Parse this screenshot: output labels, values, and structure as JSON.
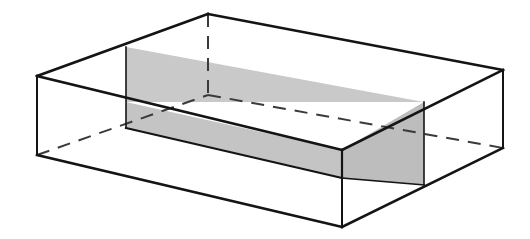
{
  "figure": {
    "caption": "",
    "background_color": "#ffffff",
    "canvas": {
      "width": 530,
      "height": 239
    }
  },
  "style": {
    "visible_edge_color": "#141414",
    "hidden_edge_color": "#3a3a3a",
    "shade_fill_top": "#c9c9c9",
    "shade_fill_front": "#c4c4c4",
    "shade_fill_right": "#bdbdbd",
    "visible_edge_width": 2.6,
    "visible_edge_width_thin": 2.0,
    "hidden_edge_width": 2.0,
    "hidden_dash_pattern": "13,9",
    "slab_edge_width": 1.6
  },
  "geometry": {
    "description": "Cuboid drawn in oblique projection with a horizontal shaded slab cutting through its interior. Hidden rear edges are dashed.",
    "vertices": {
      "box_top_back": [
        208,
        14
      ],
      "box_top_left": [
        37,
        76
      ],
      "box_top_right": [
        503,
        70
      ],
      "box_top_front": [
        342,
        150
      ],
      "box_bottom_back": [
        208,
        95
      ],
      "box_bottom_left": [
        37,
        155
      ],
      "box_bottom_right": [
        503,
        148
      ],
      "box_bottom_front": [
        342,
        227
      ]
    },
    "slab": {
      "note": "Shaded slab spans left cut plane x=126 to right cut plane x=424",
      "top_back_left": [
        126,
        47
      ],
      "top_back_right": [
        424,
        102
      ],
      "top_front_left": [
        126,
        128
      ],
      "top_front_right": [
        424,
        185
      ],
      "upper_plane_front_left": [
        126,
        102
      ],
      "upper_plane_front_right": [
        424,
        102
      ],
      "lower_edge_left": [
        126,
        128
      ],
      "lower_edge_mid": [
        342,
        178
      ],
      "lower_edge_right": [
        424,
        185
      ]
    }
  },
  "paths": {
    "box_top_face": "M 37,76 L 208,14 L 503,70 L 342,150 Z",
    "box_left_front_face": "M 37,76 L 37,155 L 342,227 L 342,150 Z",
    "box_right_front_face": "M 342,150 L 342,227 L 503,148 L 503,70 Z",
    "hidden_vertical_back": "M 208,14 L 208,95",
    "hidden_back_left": "M 37,155 L 208,95",
    "hidden_back_right": "M 208,95 L 503,148",
    "left_vertical": "M 37,76 L 37,155",
    "right_vertical": "M 503,70 L 503,148",
    "front_vertical": "M 342,150 L 342,227",
    "bottom_front_left": "M 37,155 L 342,227",
    "bottom_front_right": "M 342,227 L 503,148",
    "top_back_left": "M 37,76 L 208,14",
    "top_back_right": "M 208,14 L 503,70",
    "top_front_left": "M 37,76 L 342,150",
    "top_front_right": "M 342,150 L 503,70",
    "slab_top_face": "M 126,47 L 424,102 L 424,102 L 126,102 Z",
    "slab_left_cut": "M 126,47 L 126,128",
    "slab_right_cut": "M 424,102 L 424,185",
    "slab_front_band": "M 126,102 L 342,150 L 342,178 L 126,128 Z",
    "slab_right_band": "M 342,150 L 424,102 L 424,185 L 342,178 Z",
    "slab_upper_band": "M 126,47 L 424,102 L 424,102 L 126,102 Z"
  },
  "labels": {
    "items": []
  }
}
